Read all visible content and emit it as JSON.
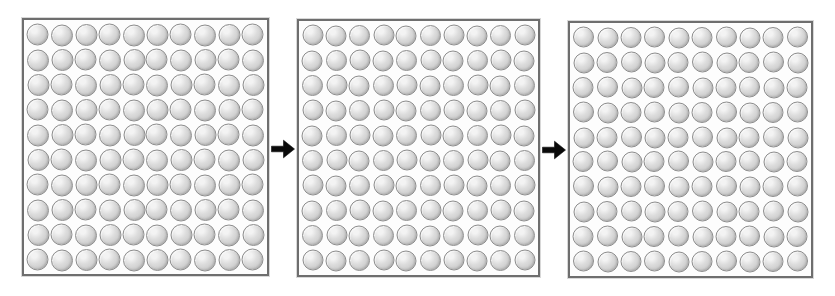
{
  "figure": {
    "background_color": "#ffffff",
    "kind": "sequence-of-arrays",
    "panel_count": 3,
    "arrow_count": 2
  },
  "chart_data": {
    "type": "table",
    "title": "",
    "subtitle": "",
    "xlabel": "",
    "ylabel": "",
    "categories": [
      "Panel 1",
      "Panel 2",
      "Panel 3"
    ],
    "values": [
      100,
      100,
      100
    ],
    "series": [
      {
        "name": "rows",
        "values": [
          10,
          10,
          10
        ]
      },
      {
        "name": "columns",
        "values": [
          10,
          10,
          10
        ]
      },
      {
        "name": "total_spheres",
        "values": [
          100,
          100,
          100
        ]
      }
    ],
    "grid": false,
    "legend_position": "none",
    "annotations": [
      "Panel 1 transforms into Panel 2 (arrow)",
      "Panel 2 transforms into Panel 3 (arrow)"
    ]
  },
  "panels": [
    {
      "id": "panel-1",
      "label": "Panel 1",
      "rows": 10,
      "cols": 10,
      "count": 100,
      "x": 22,
      "y": 18,
      "w": 247,
      "h": 258,
      "border_color": "#6e6e6e",
      "fill_color": "#fdfdfd",
      "sphere_diameter": 22
    },
    {
      "id": "panel-2",
      "label": "Panel 2",
      "rows": 10,
      "cols": 10,
      "count": 100,
      "x": 297,
      "y": 19,
      "w": 243,
      "h": 258,
      "border_color": "#6e6e6e",
      "fill_color": "#fdfdfd",
      "sphere_diameter": 21
    },
    {
      "id": "panel-3",
      "label": "Panel 3",
      "rows": 10,
      "cols": 10,
      "count": 100,
      "x": 568,
      "y": 21,
      "w": 245,
      "h": 257,
      "border_color": "#6e6e6e",
      "fill_color": "#fdfdfd",
      "sphere_diameter": 21
    }
  ],
  "arrows": [
    {
      "id": "arrow-1",
      "direction": "right",
      "color": "#0a0a0a",
      "x": 271,
      "y": 139,
      "w": 24,
      "h": 20
    },
    {
      "id": "arrow-2",
      "direction": "right",
      "color": "#0a0a0a",
      "x": 542,
      "y": 140,
      "w": 24,
      "h": 20
    }
  ],
  "sphere_style": {
    "highlight_color": "#f3f3f3",
    "mid_color": "#dcdcdc",
    "shade_color": "#bdbdbd",
    "outline_color": "#8d8d8d"
  }
}
